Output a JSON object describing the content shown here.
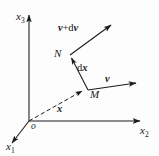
{
  "figure": {
    "background_color": "#fdfdfd",
    "ink_color": "#1a1a1a",
    "width": 159,
    "height": 156
  },
  "axes": {
    "x1": {
      "label": "x",
      "subscript": "1",
      "direction": "down-left"
    },
    "x2": {
      "label": "x",
      "subscript": "2",
      "direction": "right"
    },
    "x3": {
      "label": "x",
      "subscript": "3",
      "direction": "up"
    },
    "origin": {
      "label": "o"
    }
  },
  "points": {
    "M": {
      "label": "M"
    },
    "N": {
      "label": "N"
    }
  },
  "vectors": {
    "position": {
      "label": "x",
      "style": "dashed",
      "from": "o",
      "to": "M"
    },
    "velocity_at_M": {
      "label": "v",
      "from": "M",
      "direction": "right"
    },
    "velocity_at_N": {
      "label": "v",
      "operator": "+",
      "increment": "dv",
      "from": "N",
      "direction": "up-right"
    },
    "displacement": {
      "differential": "d",
      "label": "x",
      "from": "M",
      "to": "N"
    }
  }
}
